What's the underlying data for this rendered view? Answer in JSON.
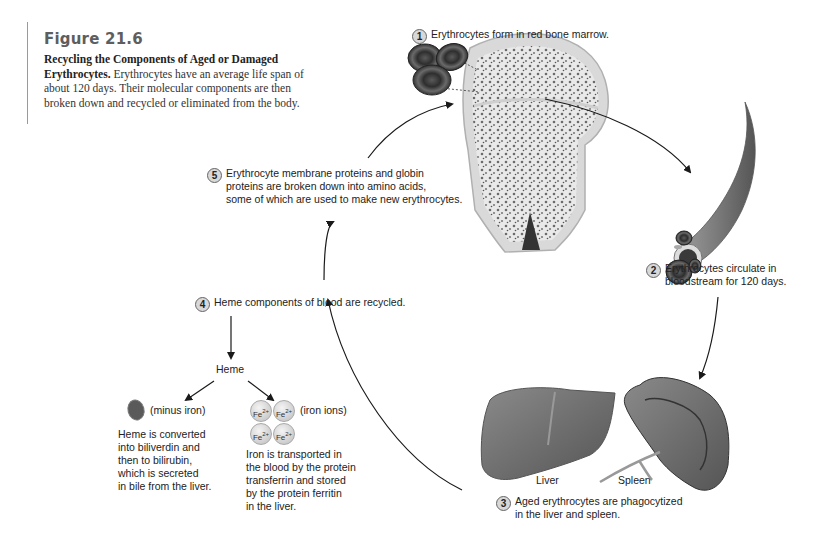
{
  "figure": {
    "title": "Figure 21.6",
    "caption_bold": "Recycling the Components of Aged or Damaged Erythrocytes.",
    "caption_text": "Erythrocytes have an average life span of about 120 days. Their molecular components are then broken down and recycled or eliminated from the body."
  },
  "steps": [
    {
      "number": "1",
      "lines": [
        "Erythrocytes form in red bone marrow."
      ]
    },
    {
      "number": "2",
      "lines": [
        "Erythrocytes circulate in",
        "bloodstream for 120 days."
      ]
    },
    {
      "number": "3",
      "lines": [
        "Aged erythrocytes are phagocytized",
        "in the liver and spleen."
      ]
    },
    {
      "number": "4",
      "lines": [
        "Heme components of blood are recycled."
      ]
    },
    {
      "number": "5",
      "lines": [
        "Erythrocyte membrane proteins and globin",
        "proteins are broken down into amino acids,",
        "some of which are used to make new erythrocytes."
      ]
    }
  ],
  "heme": {
    "label": "Heme",
    "minus_iron_label": "(minus iron)",
    "minus_iron_text": [
      "Heme is converted",
      "into biliverdin and",
      "then to bilirubin,",
      "which is secreted",
      "in bile from the liver."
    ],
    "iron_ion_label": "Fe",
    "iron_ion_charge": "2+",
    "iron_ions_label": "(iron ions)",
    "iron_text": [
      "Iron is transported in",
      "the blood by the protein",
      "transferrin and stored",
      "by the protein ferritin",
      "in the liver."
    ]
  },
  "organs": {
    "liver_label": "Liver",
    "spleen_label": "Spleen"
  },
  "colors": {
    "background": "#ffffff",
    "title_gray": "#5e5e5e",
    "cell_dark": "#4a4a4a",
    "organ_gray": "#6e6e6e",
    "arrow": "#1a1a1a"
  }
}
